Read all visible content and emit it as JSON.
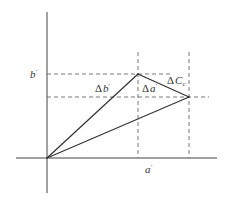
{
  "diagram": {
    "type": "vector-difference-diagram",
    "colors": {
      "axis": "#444444",
      "solid_line": "#333333",
      "dashed_line": "#555555",
      "text": "#333333",
      "background": "#ffffff"
    },
    "points": {
      "origin": {
        "x": 47,
        "y": 158
      },
      "top_vertex": {
        "x": 138,
        "y": 74
      },
      "right_vertex": {
        "x": 189,
        "y": 97
      }
    },
    "labels": {
      "b_prime": {
        "text": "b'",
        "symbol": "b",
        "prime": "'"
      },
      "a_prime": {
        "text": "a'",
        "symbol": "a",
        "prime": "'"
      },
      "delta_b_prime": {
        "delta": "Δ",
        "symbol": "b",
        "prime": "'"
      },
      "delta_a_prime": {
        "delta": "Δ",
        "symbol": "a",
        "prime": "'"
      },
      "delta_c_c": {
        "delta": "Δ",
        "symbol": "C",
        "subscript": "c"
      }
    }
  }
}
